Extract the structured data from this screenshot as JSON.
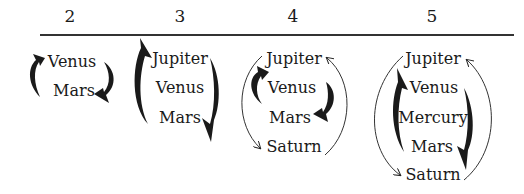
{
  "columns": [
    {
      "header": "2",
      "x": 70,
      "planets": [
        "Venus",
        "Mars"
      ],
      "ys": [
        55,
        84
      ]
    },
    {
      "header": "3",
      "x": 180,
      "planets": [
        "Jupiter",
        "Venus",
        "Mars"
      ],
      "ys": [
        47,
        76,
        106
      ]
    },
    {
      "header": "4",
      "x": 295,
      "planets": [
        "Jupiter",
        "Venus",
        "Mars",
        "Saturn"
      ],
      "ys": [
        47,
        76,
        106,
        136
      ]
    },
    {
      "header": "5",
      "x": 432,
      "planets": [
        "Jupiter",
        "Venus",
        "Mercury",
        "Mars",
        "Saturn"
      ],
      "ys": [
        47,
        76,
        106,
        136,
        164
      ]
    }
  ]
}
